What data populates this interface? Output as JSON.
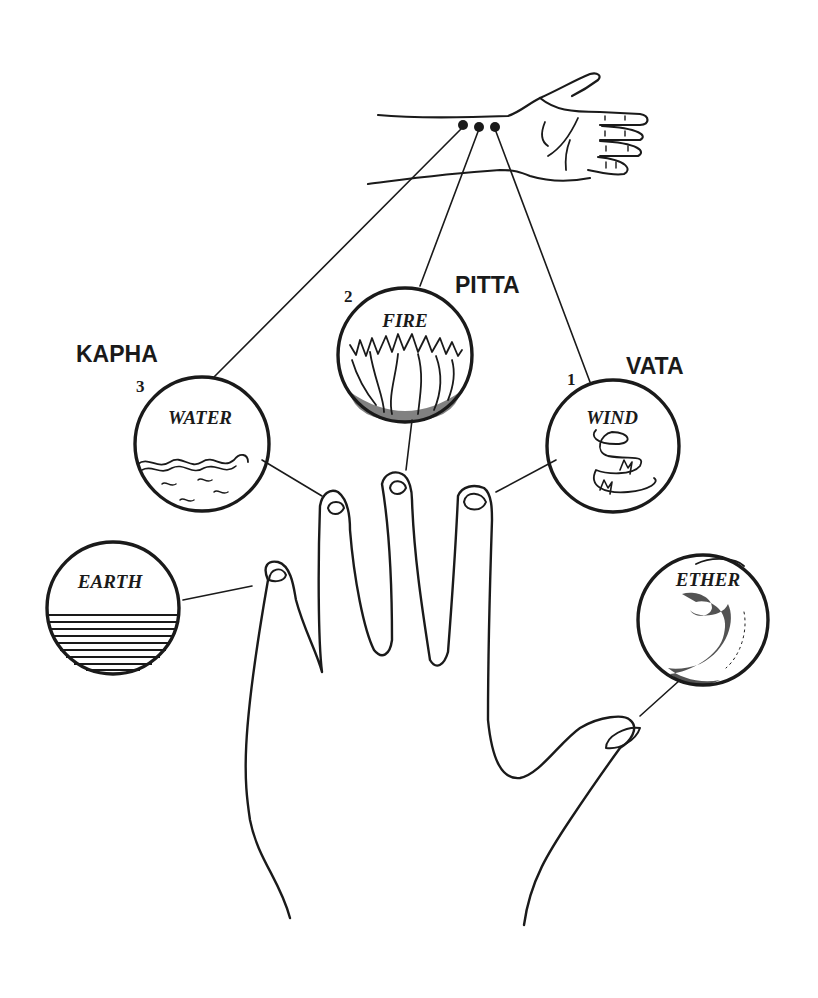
{
  "diagram": {
    "type": "ayurvedic-pulse-and-elements",
    "colors": {
      "ink": "#1a1a1a",
      "background": "#ffffff"
    },
    "wrist": {
      "pulse_points": 3
    },
    "doshas": [
      {
        "id": "vata",
        "label": "VATA",
        "number": "1",
        "element": "WIND"
      },
      {
        "id": "pitta",
        "label": "PITTA",
        "number": "2",
        "element": "FIRE"
      },
      {
        "id": "kapha",
        "label": "KAPHA",
        "number": "3",
        "element": "WATER"
      }
    ],
    "elements": [
      {
        "id": "ether",
        "label": "ETHER",
        "finger": "thumb"
      },
      {
        "id": "wind",
        "label": "WIND",
        "finger": "index"
      },
      {
        "id": "fire",
        "label": "FIRE",
        "finger": "middle"
      },
      {
        "id": "water",
        "label": "WATER",
        "finger": "ring"
      },
      {
        "id": "earth",
        "label": "EARTH",
        "finger": "little"
      }
    ]
  }
}
